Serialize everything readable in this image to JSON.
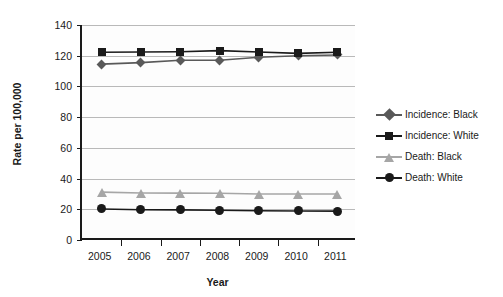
{
  "chart_data": {
    "type": "line",
    "title": "",
    "xlabel": "Year",
    "ylabel": "Rate per 100,000",
    "categories": [
      "2005",
      "2006",
      "2007",
      "2008",
      "2009",
      "2010",
      "2011"
    ],
    "x": [
      2005,
      2006,
      2007,
      2008,
      2009,
      2010,
      2011
    ],
    "ylim": [
      0,
      140
    ],
    "yticks": [
      0,
      20,
      40,
      60,
      80,
      100,
      120,
      140
    ],
    "ytick_labels": [
      "0",
      "20",
      "40",
      "60",
      "80",
      "100",
      "120",
      "140"
    ],
    "grid": "horizontal",
    "legend_position": "right",
    "series": [
      {
        "name": "Incidence: Black",
        "marker": "diamond",
        "color": "#595959",
        "line_color": "#595959",
        "values": [
          114.5,
          115.5,
          117.0,
          117.0,
          119.0,
          120.0,
          120.5
        ]
      },
      {
        "name": "Incidence: White",
        "marker": "square",
        "color": "#1a1a1a",
        "line_color": "#1a1a1a",
        "values": [
          122.3,
          122.4,
          122.6,
          123.3,
          122.4,
          121.5,
          122.3
        ]
      },
      {
        "name": "Death: Black",
        "marker": "triangle",
        "color": "#a6a6a6",
        "line_color": "#a6a6a6",
        "values": [
          31.2,
          30.6,
          30.5,
          30.4,
          30.0,
          30.0,
          30.0
        ]
      },
      {
        "name": "Death: White",
        "marker": "circle",
        "color": "#1a1a1a",
        "line_color": "#1a1a1a",
        "values": [
          20.2,
          19.7,
          19.6,
          19.4,
          19.0,
          18.9,
          18.8
        ]
      }
    ]
  },
  "legend": {
    "items": [
      {
        "label": "Incidence: Black"
      },
      {
        "label": "Incidence: White"
      },
      {
        "label": "Death: Black"
      },
      {
        "label": "Death: White"
      }
    ]
  },
  "axes": {
    "x_title": "Year",
    "y_title": "Rate per 100,000"
  },
  "colors": {
    "incidence_black": "#595959",
    "incidence_white": "#1a1a1a",
    "death_black": "#a6a6a6",
    "death_white": "#1a1a1a",
    "gridline": "#b9b9b9",
    "axis": "#1a1a1a",
    "plot_background": "#fdfdfd"
  }
}
